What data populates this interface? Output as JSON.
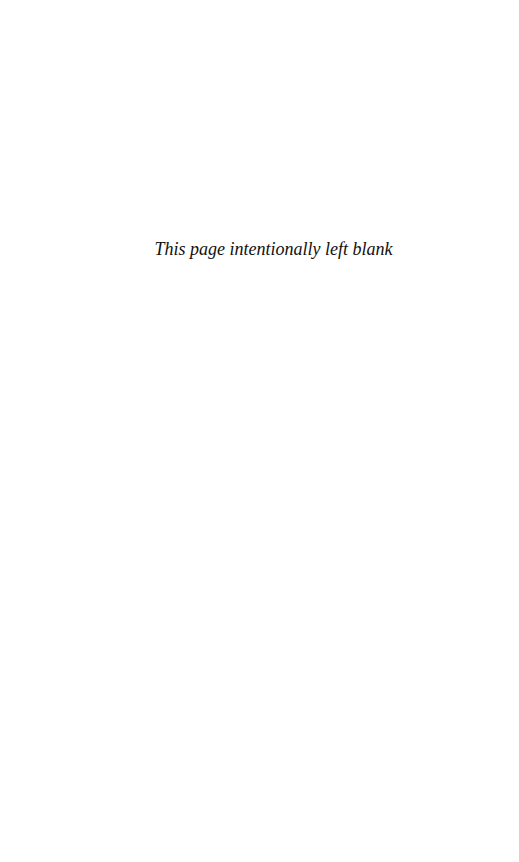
{
  "page": {
    "notice": "This page intentionally left blank",
    "background": "#ffffff",
    "text_color": "#111111"
  }
}
